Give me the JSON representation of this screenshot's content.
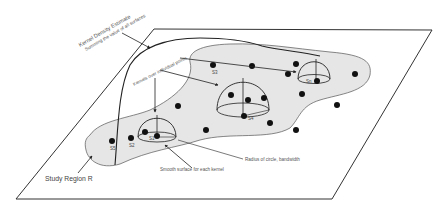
{
  "diagram": {
    "labels": {
      "kde_title": "Kernel Density Estimate",
      "kde_subtitle": "Summing the value of all surfaces",
      "kernels_over_points": "Kernels over individual points",
      "radius": "Radius of circle, bandwidth",
      "smooth_surface": "Smooth surface for each kernel",
      "study_region": "Study Region R"
    },
    "point_labels": {
      "s1": "S1",
      "s2": "S2",
      "s3": "S3",
      "s4": "S4",
      "s5": "S5",
      "sn": "Sn"
    },
    "colors": {
      "region_fill": "#e6e6e6",
      "line": "#222222",
      "point": "#111111"
    }
  }
}
